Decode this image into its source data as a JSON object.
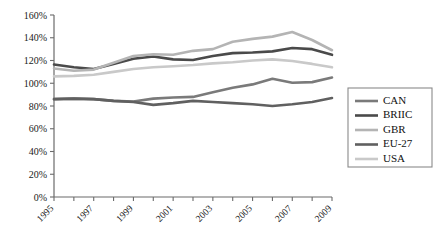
{
  "chart_data": {
    "type": "line",
    "title": "",
    "xlabel": "",
    "ylabel": "",
    "x": [
      1995,
      1996,
      1997,
      1998,
      1999,
      2000,
      2001,
      2002,
      2003,
      2004,
      2005,
      2006,
      2007,
      2008,
      2009
    ],
    "xlim": [
      1995,
      2009
    ],
    "ylim": [
      0,
      160
    ],
    "ytick_values": [
      0,
      20,
      40,
      60,
      80,
      100,
      120,
      140,
      160
    ],
    "ytick_labels": [
      "0%",
      "20%",
      "40%",
      "60%",
      "80%",
      "100%",
      "120%",
      "140%",
      "160%"
    ],
    "xtick_labels": [
      "1995",
      "1997",
      "1999",
      "2001",
      "2003",
      "2005",
      "2007",
      "2009"
    ],
    "xtick_values": [
      1995,
      1997,
      1999,
      2001,
      2003,
      2005,
      2007,
      2009
    ],
    "xtick_minor_values": [
      1996,
      1998,
      2000,
      2002,
      2004,
      2006,
      2008
    ],
    "grid": false,
    "legend_position": "right",
    "value_unit": "percent",
    "series": [
      {
        "name": "CAN",
        "color": "#7a7a7a",
        "values": [
          86,
          86.5,
          86,
          84.5,
          84,
          86.5,
          87.5,
          88,
          92,
          96,
          99,
          104,
          100.5,
          101,
          105
        ]
      },
      {
        "name": "BRIIC",
        "color": "#4a4a4a",
        "values": [
          116.5,
          114,
          112.5,
          117,
          121.5,
          123.5,
          121,
          120.5,
          124,
          126.5,
          127,
          128,
          131,
          130,
          125
        ]
      },
      {
        "name": "GBR",
        "color": "#b4b4b4",
        "values": [
          113,
          111,
          112,
          118,
          124,
          125.5,
          125,
          128.5,
          130,
          136.5,
          139,
          141,
          145,
          138,
          129
        ]
      },
      {
        "name": "EU-27",
        "color": "#606060",
        "values": [
          86,
          86.5,
          86,
          84.5,
          83.5,
          81,
          82.5,
          84.5,
          83.5,
          82.5,
          81.5,
          80,
          81.5,
          83.5,
          87
        ]
      },
      {
        "name": "USA",
        "color": "#c9c9c9",
        "values": [
          106,
          106.5,
          107.5,
          110,
          112.5,
          114,
          115,
          116,
          117.5,
          118.5,
          120,
          121,
          119.5,
          117,
          114
        ]
      }
    ]
  },
  "legend": {
    "items": [
      {
        "label": "CAN",
        "color": "#7a7a7a"
      },
      {
        "label": "BRIIC",
        "color": "#4a4a4a"
      },
      {
        "label": "GBR",
        "color": "#b4b4b4"
      },
      {
        "label": "EU-27",
        "color": "#606060"
      },
      {
        "label": "USA",
        "color": "#c9c9c9"
      }
    ]
  }
}
